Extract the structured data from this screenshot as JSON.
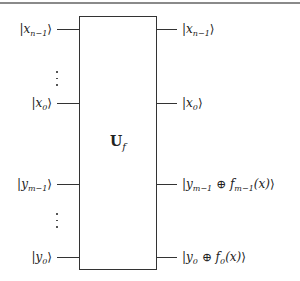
{
  "diagram": {
    "type": "quantum-circuit-oracle",
    "gate": {
      "symbol": "U",
      "subscript": "f"
    },
    "inputs": [
      {
        "var": "x",
        "sub": "n−1"
      },
      {
        "var": "x",
        "sub": "0"
      },
      {
        "var": "y",
        "sub": "m−1"
      },
      {
        "var": "y",
        "sub": "0"
      }
    ],
    "outputs": [
      {
        "pre": "x",
        "pre_sub": "n−1",
        "post": ""
      },
      {
        "pre": "x",
        "pre_sub": "0",
        "post": ""
      },
      {
        "pre": "y",
        "pre_sub": "m−1",
        "op": " ⊕ ",
        "f": "f",
        "f_sub": "m−1",
        "arg": "(x)"
      },
      {
        "pre": "y",
        "pre_sub": "0",
        "op": " ⊕ ",
        "f": "f",
        "f_sub": "0",
        "arg": "(x)"
      }
    ],
    "ellipsis": "⋮",
    "ket_open": "|",
    "ket_close": "⟩",
    "colors": {
      "line": "#333333",
      "rule": "#8a8a8a",
      "background": "#ffffff"
    }
  }
}
